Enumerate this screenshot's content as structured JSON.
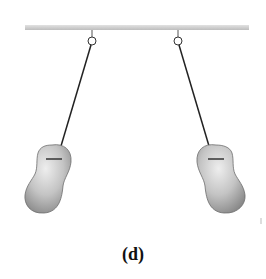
{
  "figure": {
    "label": "(d)",
    "charges": [
      {
        "id": "left",
        "sign": "−"
      },
      {
        "id": "right",
        "sign": "−"
      }
    ],
    "colors": {
      "support_bar": "#c8c8c8",
      "string": "#222222",
      "ball_fill": "#a9a9a9",
      "ball_highlight": "#e4e4e4",
      "charge_mark": "#333333"
    }
  }
}
